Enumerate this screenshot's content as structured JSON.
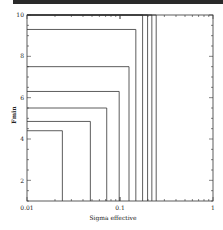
{
  "chart_data": {
    "type": "line",
    "title": "",
    "xlabel": "Sigma effective",
    "ylabel": "Fmin",
    "xscale": "log",
    "xlim": [
      0.01,
      1
    ],
    "ylim": [
      1,
      10
    ],
    "x_tick_labels": [
      "0.01",
      "0.1",
      "1"
    ],
    "y_tick_labels": [
      "2",
      "4",
      "6",
      "8",
      "10"
    ],
    "grid": false,
    "legend": null,
    "series": [
      {
        "name": "contour-1",
        "corner": {
          "sigma": 0.024,
          "fmin": 4.4
        }
      },
      {
        "name": "contour-2",
        "corner": {
          "sigma": 0.048,
          "fmin": 4.85
        }
      },
      {
        "name": "contour-3",
        "corner": {
          "sigma": 0.072,
          "fmin": 5.5
        }
      },
      {
        "name": "contour-4",
        "corner": {
          "sigma": 0.098,
          "fmin": 6.3
        }
      },
      {
        "name": "contour-5",
        "corner": {
          "sigma": 0.125,
          "fmin": 7.5
        }
      },
      {
        "name": "contour-6",
        "corner": {
          "sigma": 0.148,
          "fmin": 9.3
        }
      },
      {
        "name": "contour-7",
        "corner": {
          "sigma": 0.175,
          "fmin": 10
        }
      },
      {
        "name": "contour-8",
        "corner": {
          "sigma": 0.198,
          "fmin": 10
        }
      },
      {
        "name": "contour-9",
        "corner": {
          "sigma": 0.22,
          "fmin": 10
        }
      },
      {
        "name": "contour-10",
        "corner": {
          "sigma": 0.245,
          "fmin": 10
        }
      }
    ]
  },
  "axes": {
    "x_label": "Sigma effective",
    "y_label": "Fmin",
    "x_ticks": {
      "t0": "0.01",
      "t1": "0.1",
      "t2": "1"
    },
    "y_ticks": {
      "t2": "2",
      "t4": "4",
      "t6": "6",
      "t8": "8",
      "t10": "10"
    }
  }
}
